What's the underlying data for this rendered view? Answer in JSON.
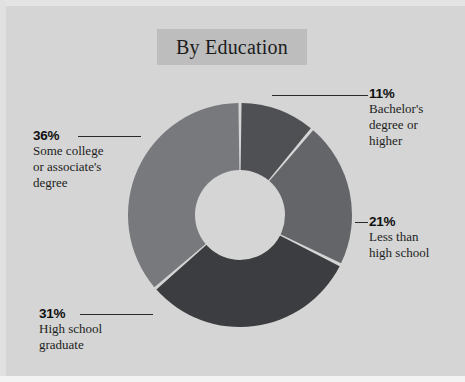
{
  "figure": {
    "title": "By Education",
    "background_color": "#d4d5d4",
    "title_box_color": "#bcbdbc"
  },
  "chart_data": {
    "type": "pie",
    "variant": "donut",
    "title": "By Education",
    "xlabel": "",
    "ylabel": "",
    "units": "percent",
    "legend_position": "none",
    "grid": false,
    "start_angle_deg": 0,
    "direction": "clockwise",
    "categories": [
      "Bachelor's degree or higher",
      "Less than high school",
      "High school graduate",
      "Some college or associate's degree"
    ],
    "values": [
      11,
      21,
      31,
      36
    ],
    "value_labels": [
      "11%",
      "21%",
      "31%",
      "36%"
    ],
    "colors": [
      "#4f5053",
      "#636568",
      "#3c3d40",
      "#77797c"
    ],
    "slices": [
      {
        "label": "Bachelor's degree or higher",
        "label_lines": [
          "Bachelor's",
          "degree or",
          "higher"
        ],
        "value": 11,
        "value_label": "11%",
        "color": "#4f5053",
        "leader": "horizontal-right"
      },
      {
        "label": "Less than high school",
        "label_lines": [
          "Less than",
          "high school"
        ],
        "value": 21,
        "value_label": "21%",
        "color": "#636568",
        "leader": "short-dash-right"
      },
      {
        "label": "High school graduate",
        "label_lines": [
          "High school",
          "graduate"
        ],
        "value": 31,
        "value_label": "31%",
        "color": "#3c3d40",
        "leader": "horizontal-left"
      },
      {
        "label": "Some college or associate's degree",
        "label_lines": [
          "Some college",
          "or associate's",
          "degree"
        ],
        "value": 36,
        "value_label": "36%",
        "color": "#77797c",
        "leader": "horizontal-left"
      }
    ]
  },
  "labels": {
    "bachelors": {
      "pct": "11%",
      "line1": "Bachelor's",
      "line2": "degree or",
      "line3": "higher"
    },
    "less_than_hs": {
      "pct": "21%",
      "line1": "Less than",
      "line2": "high school"
    },
    "some_college": {
      "pct": "36%",
      "line1": "Some college",
      "line2": "or associate's",
      "line3": "degree"
    },
    "hs_grad": {
      "pct": "31%",
      "line1": "High school",
      "line2": "graduate"
    }
  }
}
